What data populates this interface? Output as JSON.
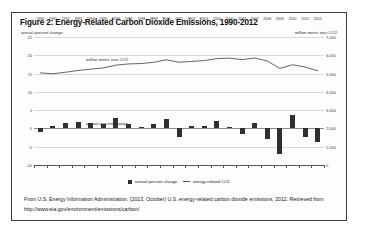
{
  "figure": {
    "title": "Figure 2: Energy-Related Carbon Dioxide Emissions, 1990-2012",
    "left_axis_label": "annual percent change",
    "right_axis_label": "million metric tons CO2",
    "inner_tag_co2": "million metric tons CO2",
    "inner_tag_pct": "annual percent change"
  },
  "legend": {
    "bars_label": "annual percent change",
    "line_label": "energy-related CO2"
  },
  "caption": {
    "line1": "From U.S. Energy Information Administration. (2013, October) U.S. energy-related carbon dioxide emissions,",
    "line2": "2012. Retrieved from http://www.eia.gov/environment/emissions/carbon/"
  },
  "colors": {
    "bar": "#2f2f2f",
    "line": "#555555",
    "grid": "#d8d8d8",
    "border": "#3a3a3a",
    "text": "#1a1a1a"
  },
  "chart_data": {
    "type": "bar",
    "title": "Figure 2: Energy-Related Carbon Dioxide Emissions, 1990-2012",
    "xlabel": "",
    "ylabel": "annual percent change",
    "y2label": "million metric tons CO2",
    "ylim": [
      -10,
      25
    ],
    "y2lim": [
      0,
      7000
    ],
    "yticks": [
      25,
      20,
      15,
      10,
      5,
      0,
      -5,
      -10
    ],
    "y2ticks": [
      7000,
      6000,
      5000,
      4000,
      3000,
      2000,
      1000,
      0
    ],
    "ytick_labels": [
      "25",
      "20",
      "15",
      "10",
      "5",
      "0",
      "-5",
      "-10"
    ],
    "y2tick_labels": [
      "7,000",
      "6,000",
      "5,000",
      "4,000",
      "3,000",
      "2,000",
      "1,000",
      "0"
    ],
    "grid": true,
    "legend_position": "bottom-center",
    "categories": [
      "1990",
      "1991",
      "1992",
      "1993",
      "1994",
      "1995",
      "1996",
      "1997",
      "1998",
      "1999",
      "2000",
      "2001",
      "2002",
      "2003",
      "2004",
      "2005",
      "2006",
      "2007",
      "2008",
      "2009",
      "2010",
      "2011",
      "2012"
    ],
    "series": [
      {
        "name": "annual percent change",
        "type": "bar",
        "axis": "left",
        "units": "percent",
        "values": [
          -1.0,
          0.6,
          1.6,
          1.8,
          1.4,
          1.1,
          2.9,
          1.2,
          0.4,
          1.2,
          2.5,
          -2.4,
          0.8,
          0.8,
          1.9,
          0.4,
          -1.4,
          1.6,
          -2.8,
          -7.1,
          3.8,
          -2.3,
          -3.8
        ]
      },
      {
        "name": "energy-related CO2",
        "type": "line",
        "axis": "right",
        "units": "million metric tons CO2",
        "values": [
          5039,
          4991,
          5073,
          5169,
          5241,
          5308,
          5462,
          5527,
          5549,
          5616,
          5756,
          5620,
          5663,
          5709,
          5818,
          5843,
          5762,
          5854,
          5689,
          5282,
          5483,
          5358,
          5155
        ]
      }
    ]
  }
}
